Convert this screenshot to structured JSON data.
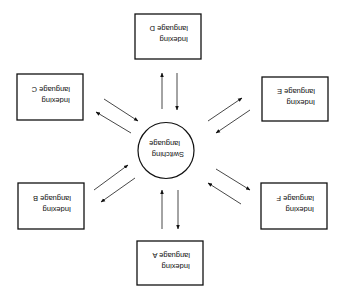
{
  "diagram": {
    "orientation": "rotated-180",
    "center": {
      "line1": "Switching",
      "line2": "language"
    },
    "nodes": [
      {
        "id": "A",
        "line1": "Indexing",
        "line2": "language A"
      },
      {
        "id": "B",
        "line1": "Indexing",
        "line2": "language B"
      },
      {
        "id": "C",
        "line1": "Indexing",
        "line2": "language C"
      },
      {
        "id": "D",
        "line1": "Indexing",
        "line2": "language D"
      },
      {
        "id": "E",
        "line1": "Indexing",
        "line2": "language E"
      },
      {
        "id": "F",
        "line1": "Indexing",
        "line2": "language F"
      }
    ],
    "edges": [
      {
        "from": "Switching language",
        "to": "Indexing language A"
      },
      {
        "from": "Indexing language A",
        "to": "Switching language"
      },
      {
        "from": "Switching language",
        "to": "Indexing language B"
      },
      {
        "from": "Indexing language B",
        "to": "Switching language"
      },
      {
        "from": "Switching language",
        "to": "Indexing language C"
      },
      {
        "from": "Indexing language C",
        "to": "Switching language"
      },
      {
        "from": "Switching language",
        "to": "Indexing language D"
      },
      {
        "from": "Indexing language D",
        "to": "Switching language"
      },
      {
        "from": "Switching language",
        "to": "Indexing language E"
      },
      {
        "from": "Indexing language E",
        "to": "Switching language"
      },
      {
        "from": "Switching language",
        "to": "Indexing language F"
      },
      {
        "from": "Indexing language F",
        "to": "Switching language"
      }
    ]
  }
}
